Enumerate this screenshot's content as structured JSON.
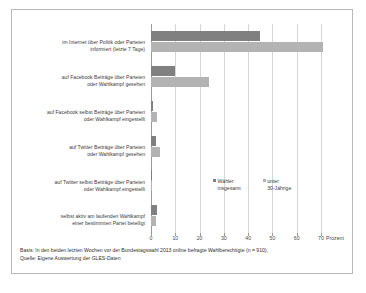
{
  "chart_data": {
    "type": "bar",
    "orientation": "horizontal",
    "title": "",
    "xlabel": "Prozent",
    "ylabel": "",
    "xlim": [
      0,
      70
    ],
    "xticks": [
      "0",
      "10",
      "20",
      "30",
      "40",
      "50",
      "60",
      "70"
    ],
    "grid": true,
    "legend_position": "inside-middle-right",
    "categories": [
      "im Internet über Politik oder Parteien informiert (letzte 7 Tage)",
      "auf Facebook Beiträge über Parteien oder Wahlkampf gesehen",
      "auf Facebook selbst Beiträge über Parteien oder Wahlkampf eingestellt",
      "auf Twitter Beiträge über Parteien oder Wahlkampf gesehen",
      "auf Twitter selbst Beiträge über Parteien oder Wahlkampf eingestellt",
      "selbst aktiv am laufenden Wahlkampf einer bestimmten Partei beteiligt"
    ],
    "category_lines": [
      [
        "im Internet über Politik oder Parteien",
        "informiert (letzte 7 Tage)"
      ],
      [
        "auf Facebook Beiträge über Parteien",
        "oder Wahlkampf gesehen"
      ],
      [
        "auf Facebook selbst Beiträge über Parteien",
        "oder Wahlkampf eingestellt"
      ],
      [
        "auf Twitter Beiträge über Parteien",
        "oder Wahlkampf gesehen"
      ],
      [
        "auf Twitter selbst Beiträge über Parteien",
        "oder Wahlkampf eingestellt"
      ],
      [
        "selbst aktiv am laufenden Wahlkampf",
        "einer bestimmten Partei beteiligt"
      ]
    ],
    "series": [
      {
        "name": "Wähler insgesamt",
        "name_lines": [
          "Wähler",
          "insgesamt"
        ],
        "color": "#808080",
        "values": [
          45,
          10,
          1,
          2,
          0.5,
          2.5
        ]
      },
      {
        "name": "unter 30-Jährige",
        "name_lines": [
          "unter",
          "30-Jährige"
        ],
        "color": "#b3b3b3",
        "values": [
          71,
          24,
          2.5,
          3.5,
          0.5,
          2
        ]
      }
    ]
  },
  "footnote": {
    "line1": "Basis: In den beiden letzten Wochen vor der Bundestagswahl 2013 online befragte Wahlberechtigte (n = 910);",
    "line2": "Quelle: Eigene Auswertung der GLES-Daten"
  },
  "colors": {
    "series_1": "#808080",
    "series_2": "#b3b3b3",
    "grid": "#d6d6d6",
    "axis": "#9a9a9a",
    "border": "#b9b9b9",
    "text": "#3b3b3b"
  }
}
